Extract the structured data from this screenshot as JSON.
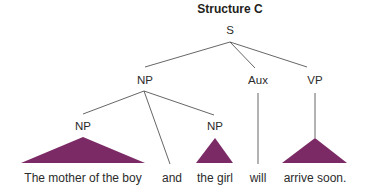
{
  "title": "Structure C",
  "colors": {
    "triangle": "#7b2a66",
    "line": "#555555",
    "text": "#2b2b2b"
  },
  "nodes": {
    "root": "S",
    "np_main": "NP",
    "aux": "Aux",
    "vp": "VP",
    "np_left": "NP",
    "np_right": "NP"
  },
  "words": {
    "np_left_text": "The mother of the boy",
    "conj": "and",
    "np_right_text": "the girl",
    "aux_text": "will",
    "vp_text": "arrive soon."
  },
  "structure": [
    {
      "parent": "S",
      "children": [
        "NP",
        "Aux",
        "VP"
      ]
    },
    {
      "parent": "NP",
      "children": [
        "NP",
        "and",
        "NP"
      ]
    },
    {
      "parent": "NP (left)",
      "children": [
        "The mother of the boy"
      ],
      "collapsed": true
    },
    {
      "parent": "NP (right)",
      "children": [
        "the girl"
      ],
      "collapsed": true
    },
    {
      "parent": "Aux",
      "children": [
        "will"
      ]
    },
    {
      "parent": "VP",
      "children": [
        "arrive soon."
      ],
      "collapsed": true
    }
  ]
}
